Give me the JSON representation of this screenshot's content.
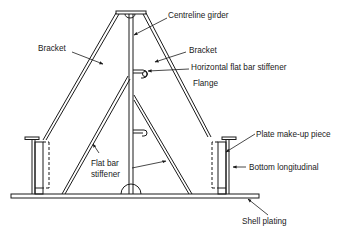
{
  "diagram": {
    "type": "ship structural cross-section (bracket floor)",
    "colors": {
      "line": "#1a1a1a",
      "background": "#ffffff"
    },
    "labels": {
      "centreline_girder": "Centreline girder",
      "bracket_left": "Bracket",
      "bracket_right": "Bracket",
      "horizontal_stiffener": "Horizontal flat bar stiffener",
      "flange": "Flange",
      "flat_bar_stiffener_line1": "Flat bar",
      "flat_bar_stiffener_line2": "stiffener",
      "plate_makeup": "Plate make-up piece",
      "bottom_longitudinal": "Bottom longitudinal",
      "shell_plating": "Shell plating"
    }
  }
}
